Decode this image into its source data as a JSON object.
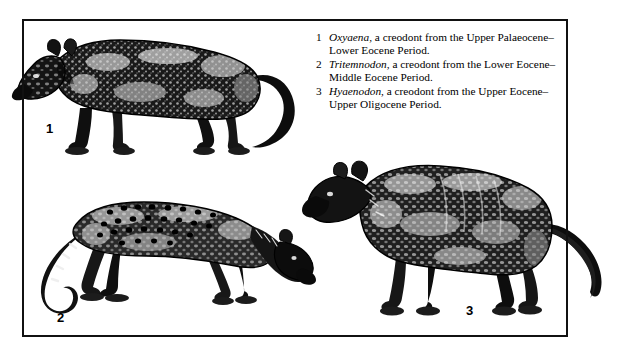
{
  "figure": {
    "type": "scientific-illustration-plate",
    "border_color": "#111111",
    "background_color": "#ffffff",
    "ink_color": "#000000"
  },
  "caption": {
    "items": [
      {
        "number": "1",
        "genus": "Oxyaena,",
        "description": " a creodont from the Upper Palaeocene–Lower Eocene Period."
      },
      {
        "number": "2",
        "genus": "Tritemnodon,",
        "description": " a creodont from the Lower Eocene–Middle Eocene Period."
      },
      {
        "number": "3",
        "genus": "Hyaenodon,",
        "description": " a creodont from the Upper Eocene–Upper Oligocene Period."
      }
    ]
  },
  "figure_labels": {
    "one": "1",
    "two": "2",
    "three": "3"
  },
  "illustrations": [
    {
      "id": "oxyaena",
      "label": "1",
      "name": "Oxyaena",
      "description": "Stocky cat-like creodont facing left with a long trailing tail"
    },
    {
      "id": "tritemnodon",
      "label": "2",
      "name": "Tritemnodon",
      "description": "Slender spotted dog-like creodont facing right with lowered head and curled tail"
    },
    {
      "id": "hyaenodon",
      "label": "3",
      "name": "Hyaenodon",
      "description": "Heavy hyena-like creodont facing left with a long tapering tail"
    }
  ]
}
